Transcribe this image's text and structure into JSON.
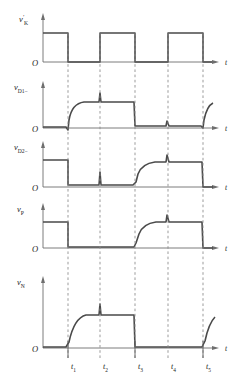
{
  "figure": {
    "kind": "timing-waveform-diagram",
    "background_color": "#ffffff",
    "trace_color": "#4a4a4a",
    "axis_color": "#6e6e6e",
    "dashed_guide_color": "#8a8a8a",
    "width": 243,
    "height": 380,
    "time_axis_label": "t",
    "origin_label": "O"
  },
  "time_markers": [
    {
      "id": "t1",
      "base": "t",
      "sub": "1",
      "x": 68
    },
    {
      "id": "t2",
      "base": "t",
      "sub": "2",
      "x": 100
    },
    {
      "id": "t3",
      "base": "t",
      "sub": "3",
      "x": 135
    },
    {
      "id": "t4",
      "base": "t",
      "sub": "4",
      "x": 168
    },
    {
      "id": "t5",
      "base": "t",
      "sub": "5",
      "x": 203
    }
  ],
  "panels": [
    {
      "name": "vK-prime",
      "label_base": "v",
      "label_prime": "′",
      "label_sub": "K",
      "label_sub_italic": false,
      "baseline_y": 62,
      "high_y": 33,
      "shape": "square-wave",
      "description": "Square wave: high from start to t1, low t1-t2, high t2-t3, low t3-t4, high t4-t5, low after t5",
      "segments": [
        {
          "from": "start",
          "to": "t1",
          "level": "high"
        },
        {
          "from": "t1",
          "to": "t2",
          "level": "low"
        },
        {
          "from": "t2",
          "to": "t3",
          "level": "high"
        },
        {
          "from": "t3",
          "to": "t4",
          "level": "low"
        },
        {
          "from": "t4",
          "to": "t5",
          "level": "high"
        },
        {
          "from": "t5",
          "to": "end",
          "level": "low"
        }
      ]
    },
    {
      "name": "vD1-minus",
      "label_base": "v",
      "label_prime": "",
      "label_sub": "D1−",
      "label_sub_italic": false,
      "baseline_y": 128,
      "high_y": 101,
      "shape": "exponential-rise-with-spikes",
      "description": "Low until t1, exponential rise at t1 to high plateau, narrow upward spike at t2, falls to low at t3, small bump at t4, exponential rise again at t5",
      "events": [
        {
          "at": "t1",
          "kind": "exponential-rise"
        },
        {
          "at": "t2",
          "kind": "spike-up"
        },
        {
          "at": "t3",
          "kind": "fall"
        },
        {
          "at": "t4",
          "kind": "small-bump"
        },
        {
          "at": "t5",
          "kind": "exponential-rise"
        }
      ]
    },
    {
      "name": "vD2-minus",
      "label_base": "v",
      "label_prime": "",
      "label_sub": "D2−",
      "label_sub_italic": false,
      "baseline_y": 187,
      "high_y": 160,
      "shape": "square-with-spikes",
      "description": "High from start to t1, falls to low at t1, narrow upward spike at t2, exponential rise at t3 to plateau, spike at t4, falls at t5",
      "events": [
        {
          "at": "t1",
          "kind": "fall"
        },
        {
          "at": "t2",
          "kind": "spike-up"
        },
        {
          "at": "t3",
          "kind": "exponential-rise"
        },
        {
          "at": "t4",
          "kind": "spike-up"
        },
        {
          "at": "t5",
          "kind": "fall"
        }
      ]
    },
    {
      "name": "vP",
      "label_base": "v",
      "label_prime": "",
      "label_sub": "P",
      "label_sub_italic": false,
      "baseline_y": 248,
      "high_y": 222,
      "shape": "square-with-spike",
      "description": "High from start to t1, falls at t1, stays low through t2, exponential rise at t3, spike at t4, falls at t5",
      "events": [
        {
          "at": "t1",
          "kind": "fall"
        },
        {
          "at": "t3",
          "kind": "exponential-rise"
        },
        {
          "at": "t4",
          "kind": "spike-up"
        },
        {
          "at": "t5",
          "kind": "fall"
        }
      ]
    },
    {
      "name": "vN",
      "label_base": "v",
      "label_prime": "",
      "label_sub": "N",
      "label_sub_italic": false,
      "baseline_y": 348,
      "high_y": 313,
      "shape": "exponential-rise-with-spike",
      "description": "Low until t1, exponential rise at t1, spike at t2, falls at t3, low through t4, exponential rise at t5",
      "events": [
        {
          "at": "t1",
          "kind": "exponential-rise"
        },
        {
          "at": "t2",
          "kind": "spike-up"
        },
        {
          "at": "t3",
          "kind": "fall"
        },
        {
          "at": "t5",
          "kind": "exponential-rise"
        }
      ]
    }
  ]
}
